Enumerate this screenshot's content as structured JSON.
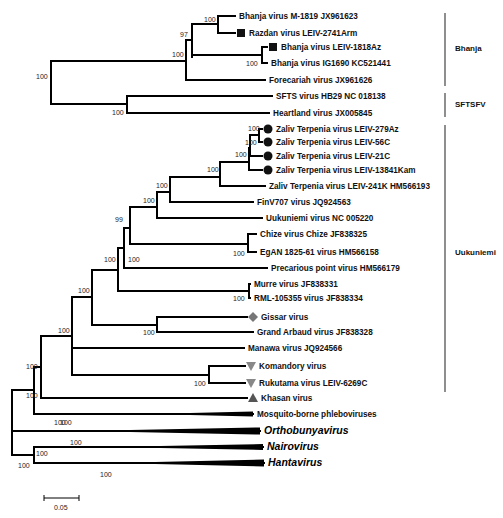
{
  "figure": {
    "type": "phylogenetic-tree",
    "scale_bar": {
      "label": "0.05",
      "value": 0.05
    }
  },
  "taxa": [
    {
      "id": "t1",
      "label": "Bhanja virus M-1819 JX961623",
      "marker": null
    },
    {
      "id": "t2",
      "label": "Razdan virus LEIV-2741Arm",
      "marker": "square"
    },
    {
      "id": "t3",
      "label": "Bhanja virus LEIV-1818Az",
      "marker": "square"
    },
    {
      "id": "t4",
      "label": "Bhanja virus IG1690 KC521441",
      "marker": null
    },
    {
      "id": "t5",
      "label": "Forecariah virus JX961626",
      "marker": null
    },
    {
      "id": "t6",
      "label": "SFTS virus HB29 NC 018138",
      "marker": null
    },
    {
      "id": "t7",
      "label": "Heartland virus JX005845",
      "marker": null
    },
    {
      "id": "t8",
      "label": "Zaliv Terpenia virus LEIV-279Az",
      "marker": "circle"
    },
    {
      "id": "t9",
      "label": "Zaliv Terpenia virus LEIV-56C",
      "marker": "circle"
    },
    {
      "id": "t10",
      "label": "Zaliv Terpenia virus LEIV-21C",
      "marker": "circle"
    },
    {
      "id": "t11",
      "label": "Zaliv Terpenia virus LEIV-13841Kam",
      "marker": "circle"
    },
    {
      "id": "t12",
      "label": "Zaliv Terpenia virus LEIV-241K HM566193",
      "marker": null
    },
    {
      "id": "t13",
      "label": "FinV707 virus JQ924563",
      "marker": null
    },
    {
      "id": "t14",
      "label": "Uukuniemi virus NC 005220",
      "marker": null
    },
    {
      "id": "t15",
      "label": "Chize virus Chize JF838325",
      "marker": null
    },
    {
      "id": "t16",
      "label": "EgAN 1825-61 virus HM566158",
      "marker": null
    },
    {
      "id": "t17",
      "label": "Precarious point virus HM566179",
      "marker": null
    },
    {
      "id": "t18",
      "label": "Murre virus JF838331",
      "marker": null
    },
    {
      "id": "t19",
      "label": "RML-105355 virus JF838334",
      "marker": null
    },
    {
      "id": "t20",
      "label": "Gissar virus",
      "marker": "diamond"
    },
    {
      "id": "t21",
      "label": "Grand Arbaud virus JF838328",
      "marker": null
    },
    {
      "id": "t22",
      "label": "Manawa virus JQ924566",
      "marker": null
    },
    {
      "id": "t23",
      "label": "Komandory virus",
      "marker": "triangle-down"
    },
    {
      "id": "t24",
      "label": "Rukutama virus LEIV-6269C",
      "marker": "triangle-down"
    },
    {
      "id": "t25",
      "label": "Khasan virus",
      "marker": "triangle-up"
    },
    {
      "id": "t26",
      "label": "Mosquito-borne phleboviruses",
      "marker": null,
      "collapsed": true
    },
    {
      "id": "t27",
      "label": "Orthobunyavirus",
      "marker": null,
      "collapsed": true,
      "italic": true
    },
    {
      "id": "t28",
      "label": "Nairovirus",
      "marker": null,
      "collapsed": true,
      "italic": true
    },
    {
      "id": "t29",
      "label": "Hantavirus",
      "marker": null,
      "collapsed": true,
      "italic": true
    }
  ],
  "bootstrap": {
    "bhanja_m1819_razdan": "100",
    "bhanja_inner": "97",
    "bhanja_clade": "100",
    "bhanja_1818_ig1690": "100",
    "sfts_heartland": "100",
    "bhanja_sftsfv": "100",
    "zt_279_56": "100",
    "zt_279_56_21": "100",
    "zt_four": "100",
    "zt_all": "100",
    "zt_finv": "100",
    "zt_uuk": "100",
    "chize_egan": "100",
    "core_99": "99",
    "prec_core": "100",
    "murre_rml": "100",
    "uuk_group": "100",
    "gissar_grand": "100",
    "uuk_big": "100",
    "komandory_rukutama": "100",
    "manawa_group": "100",
    "khasan_group": "100",
    "phlebo": "100",
    "tick_phlebo": "100",
    "phlebovirus_all": "100",
    "ortho": "100",
    "nairo_hanta": "100",
    "nairo": "100",
    "hanta": "100"
  },
  "clades": [
    {
      "name": "Bhanja"
    },
    {
      "name": "SFTSFV"
    },
    {
      "name": "Uukuniemi"
    }
  ],
  "colors": {
    "branch": "#000000",
    "marker_black": "#111111",
    "marker_gray": "#777777",
    "clade_bar": "#444444"
  }
}
